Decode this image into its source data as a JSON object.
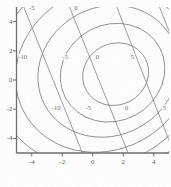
{
  "figure": {
    "kind": "contour-plot",
    "background": "#ffffff",
    "line_color": "#7a7a7a",
    "axis_color": "#6b6b6b",
    "label_color": "#5a5a5a"
  },
  "chart_data": {
    "type": "line",
    "title": "",
    "xlabel": "",
    "ylabel": "",
    "xlim": [
      -5,
      5
    ],
    "ylim": [
      -5,
      5
    ],
    "grid": false,
    "legend": null,
    "x_ticks": [
      -4,
      -2,
      0,
      2,
      4
    ],
    "x_tick_labels": [
      "-4",
      "-2",
      "0",
      "2",
      "4"
    ],
    "y_ticks": [
      -4,
      -2,
      0,
      2,
      4
    ],
    "y_tick_labels": [
      "-4",
      "-2",
      "0",
      "2",
      "4"
    ],
    "contour_levels": [
      -10,
      -5,
      0,
      5
    ],
    "contour_center": [
      1.5,
      0.4
    ],
    "ellipse_contours": [
      {
        "level": "5",
        "cx": 1.5,
        "cy": 0.4,
        "rx": 2.2,
        "ry": 2.1,
        "rot": -28
      },
      {
        "level": "0",
        "cx": 1.3,
        "cy": 0.5,
        "rx": 3.5,
        "ry": 3.3,
        "rot": -28
      },
      {
        "level": "-5",
        "cx": 1.0,
        "cy": 0.6,
        "rx": 4.7,
        "ry": 4.4,
        "rot": -28
      },
      {
        "level": "-10",
        "cx": 0.7,
        "cy": 0.7,
        "rx": 5.9,
        "ry": 5.5,
        "rot": -28
      },
      {
        "level": "-15",
        "cx": 0.4,
        "cy": 0.8,
        "rx": 7.0,
        "ry": 6.6,
        "rot": -28
      },
      {
        "level": "-20",
        "cx": 0.1,
        "cy": 0.9,
        "rx": 8.1,
        "ry": 7.7,
        "rot": -28
      }
    ],
    "diagonal_lines": [
      {
        "label": "-5",
        "x0": -4.6,
        "y0": 5.2,
        "x1": -0.6,
        "y1": -5.2
      },
      {
        "label": "0",
        "x0": -1.6,
        "y0": 5.2,
        "x1": 2.4,
        "y1": -5.2
      },
      {
        "label": "5",
        "x0": 1.5,
        "y0": 5.2,
        "x1": 5.4,
        "y1": -5.2
      },
      {
        "label": "",
        "x0": 4.3,
        "y0": 5.2,
        "x1": 5.4,
        "y1": 2.3
      }
    ],
    "contour_labels": [
      {
        "text": "-5",
        "x": -4.0,
        "y": 4.9
      },
      {
        "text": "0",
        "x": -1.1,
        "y": 4.9
      },
      {
        "text": "-10",
        "x": -4.6,
        "y": 1.6
      },
      {
        "text": "-5",
        "x": -1.8,
        "y": 1.6
      },
      {
        "text": "0",
        "x": 0.3,
        "y": 1.6
      },
      {
        "text": "5",
        "x": 2.6,
        "y": 1.6
      },
      {
        "text": "-10",
        "x": -2.4,
        "y": -1.9
      },
      {
        "text": "-5",
        "x": -0.3,
        "y": -1.9
      },
      {
        "text": "0",
        "x": 2.2,
        "y": -1.9
      },
      {
        "text": "5",
        "x": 4.7,
        "y": -1.9
      }
    ]
  }
}
